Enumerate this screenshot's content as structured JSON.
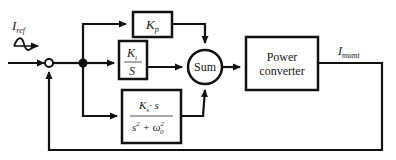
{
  "diagram": {
    "type": "control block diagram",
    "input": {
      "label_main": "I",
      "label_sub": "ref",
      "icon": "sine-wave-source-icon"
    },
    "output": {
      "label_main": "I",
      "label_sub": "mumt"
    },
    "blocks": {
      "kp": {
        "main": "K",
        "sub": "p"
      },
      "ki": {
        "num_main": "K",
        "num_sub": "i",
        "den": "S"
      },
      "ks": {
        "num_main": "K",
        "num_sub": "s",
        "num_rest": "· s",
        "den_s": "s",
        "den_s_exp": "2",
        "den_plus": " + ω",
        "den_w_sub": "0",
        "den_w_exp": "2"
      },
      "sum": {
        "label": "Sum"
      },
      "power_converter": {
        "line1": "Power",
        "line2": "converter"
      }
    },
    "colors": {
      "stroke": "#111111",
      "background": "#ffffff"
    }
  }
}
